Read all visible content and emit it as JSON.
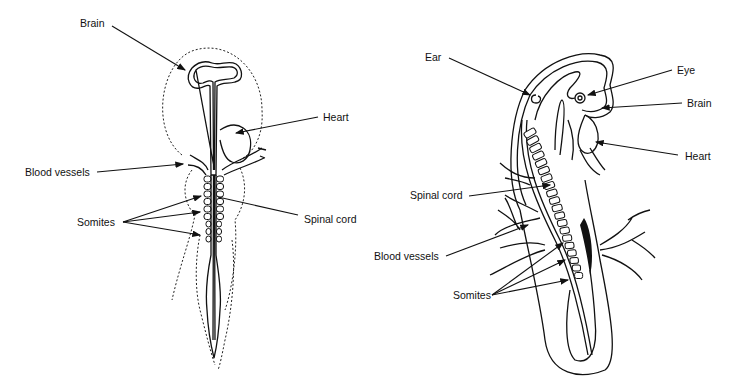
{
  "diagram": {
    "left_embryo": {
      "labels": {
        "brain": "Brain",
        "heart": "Heart",
        "blood_vessels": "Blood vessels",
        "somites": "Somites",
        "spinal_cord": "Spinal cord"
      }
    },
    "right_embryo": {
      "labels": {
        "ear": "Ear",
        "eye": "Eye",
        "brain": "Brain",
        "heart": "Heart",
        "spinal_cord": "Spinal cord",
        "blood_vessels": "Blood vessels",
        "somites": "Somites"
      }
    }
  }
}
